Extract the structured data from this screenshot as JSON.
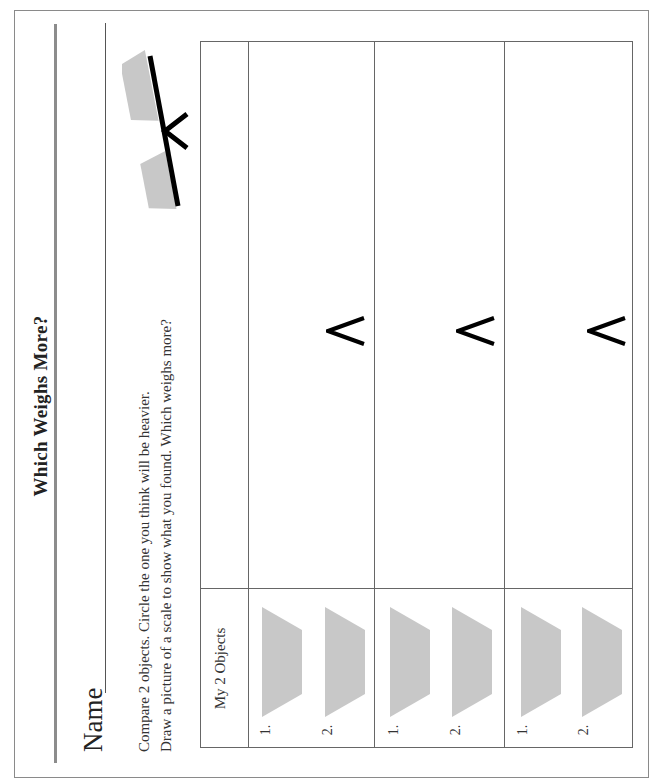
{
  "worksheet": {
    "title": "Which Weighs More?",
    "name_label": "Name",
    "instructions": [
      "Compare 2 objects. Circle the one you think will be heavier.",
      "Draw a picture of a scale to show what you found. Which weighs more?"
    ],
    "scale_icon": "balance-scale-icon",
    "table": {
      "header": "My 2 Objects",
      "rows": [
        {
          "object_labels": [
            "1.",
            "2."
          ],
          "comparison_symbol": "<"
        },
        {
          "object_labels": [
            "1.",
            "2."
          ],
          "comparison_symbol": "<"
        },
        {
          "object_labels": [
            "1.",
            "2."
          ],
          "comparison_symbol": "<"
        }
      ]
    },
    "colors": {
      "object_fill": "#c8c8c8",
      "rule_line": "#8c8c8c",
      "text": "#222222"
    }
  }
}
